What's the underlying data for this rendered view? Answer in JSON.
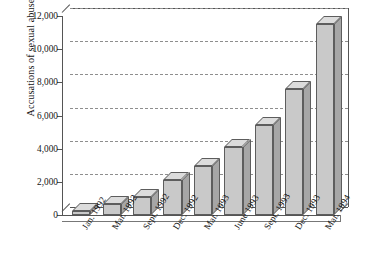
{
  "chart_data": {
    "type": "bar",
    "title": "",
    "xlabel": "",
    "ylabel": "Accusations of sexual abuse",
    "categories": [
      "Jan. 1992",
      "Mar. 1992",
      "Sept. 1992",
      "Dec. 1992",
      "Mar. 1993",
      "June 1993",
      "Sept. 1993",
      "Dec. 1993",
      "Mar. 1994"
    ],
    "values": [
      250,
      650,
      1100,
      2100,
      2950,
      4100,
      5400,
      7600,
      11500
    ],
    "ylim": [
      0,
      12000
    ],
    "yticks": [
      0,
      2000,
      4000,
      6000,
      8000,
      10000,
      12000
    ],
    "ytick_labels": [
      "0",
      "2,000",
      "4,000",
      "6,000",
      "8,000",
      "10,000",
      "12,000"
    ],
    "grid": true,
    "legend": null,
    "style": {
      "bar_face_color": "#c9c9c9",
      "bar_side_color": "#a6a6a6",
      "bar_top_color": "#dcdcdc",
      "bar_edge_color": "#5d5d5d",
      "gridline_color": "#8e8e8e",
      "axis_color": "#555555",
      "background_color": "#ffffff",
      "three_d": true
    }
  }
}
